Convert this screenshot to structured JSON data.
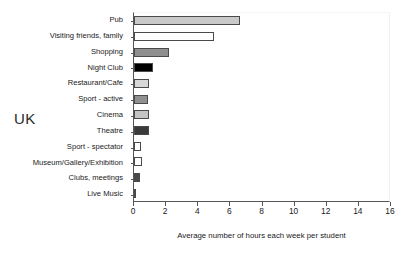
{
  "region": "UK",
  "chart_data": {
    "type": "bar",
    "orientation": "horizontal",
    "title": "",
    "subtitle": "",
    "xlabel": "Average number of hours each week per student",
    "ylabel": "",
    "xlim": [
      0,
      16
    ],
    "xticks": [
      0,
      2,
      4,
      6,
      8,
      10,
      12,
      14,
      16
    ],
    "xticklabels": [
      "0",
      "2",
      "4",
      "6",
      "8",
      "10",
      "12",
      "14",
      "16"
    ],
    "grid": false,
    "legend": null,
    "annotations": [
      "UK"
    ],
    "categories": [
      "Pub",
      "Visiting friends, family",
      "Shopping",
      "Night Club",
      "Restaurant/Cafe",
      "Sport - active",
      "Cinema",
      "Theatre",
      "Sport - spectator",
      "Museum/Gallery/Exhibition",
      "Clubs, meetings",
      "Live Music"
    ],
    "values": [
      6.6,
      5.0,
      2.15,
      1.2,
      0.95,
      0.9,
      0.95,
      0.95,
      0.45,
      0.5,
      0.4,
      0.15
    ],
    "bar_colors": [
      "#c9c9c9",
      "#ffffff",
      "#8f8f8f",
      "#000000",
      "#d8d8d8",
      "#909090",
      "#c4c4c4",
      "#3a3a3a",
      "#ffffff",
      "#ffffff",
      "#4a4a4a",
      "#e8e8e8"
    ],
    "bar_edge_color": "#4a4a4a",
    "axis_color": "#555555",
    "background": "#ffffff"
  }
}
